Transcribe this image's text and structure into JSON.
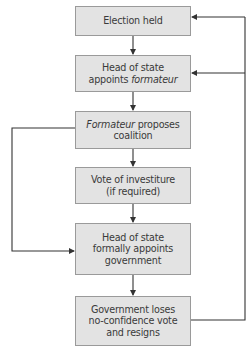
{
  "diagram": {
    "type": "flowchart",
    "colors": {
      "box_fill": "#e3e3e3",
      "box_border": "#9a9a9a",
      "line": "#333333",
      "text": "#3a3a3a"
    },
    "nodes": [
      {
        "id": "election",
        "line1": "Election held"
      },
      {
        "id": "appoint-formateur",
        "line1": "Head of state",
        "line2_plain": "appoints ",
        "line2_italic": "formateur"
      },
      {
        "id": "propose-coalition",
        "line1_italic": "Formateur",
        "line1_plain": " proposes",
        "line2": "coalition"
      },
      {
        "id": "investiture",
        "line1": "Vote of investiture",
        "line2": "(if required)"
      },
      {
        "id": "formal-appoint",
        "line1": "Head of state",
        "line2": "formally appoints",
        "line3": "government"
      },
      {
        "id": "loses-confidence",
        "line1": "Government loses",
        "line2": "no-confidence vote",
        "line3": "and resigns"
      }
    ],
    "edges": [
      {
        "from": "election",
        "to": "appoint-formateur"
      },
      {
        "from": "appoint-formateur",
        "to": "propose-coalition"
      },
      {
        "from": "propose-coalition",
        "to": "investiture"
      },
      {
        "from": "investiture",
        "to": "formal-appoint"
      },
      {
        "from": "propose-coalition",
        "to": "formal-appoint",
        "route": "left-bypass"
      },
      {
        "from": "formal-appoint",
        "to": "loses-confidence"
      },
      {
        "from": "loses-confidence",
        "to": "election",
        "route": "right-feedback"
      },
      {
        "from": "loses-confidence",
        "to": "appoint-formateur",
        "route": "right-feedback"
      }
    ]
  }
}
